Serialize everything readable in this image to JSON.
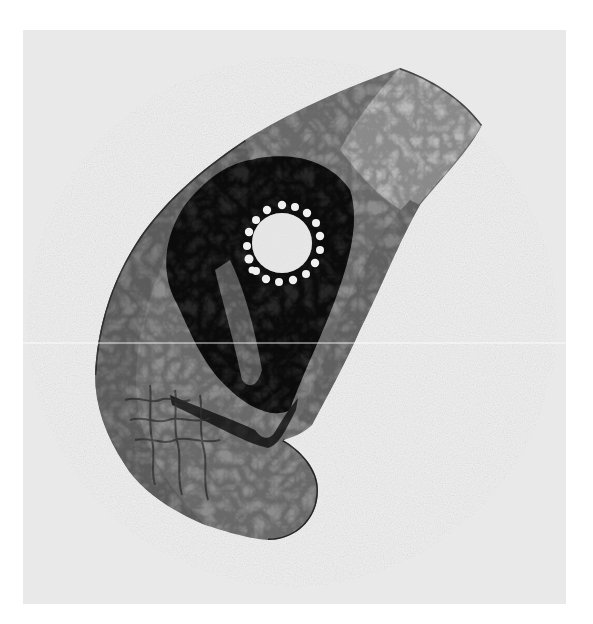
{
  "image": {
    "description": "Grayscale micrograph of a curved tissue section with a bright circular body ringed by small beads",
    "colors": {
      "page": "#ffffff",
      "plate": "#e9e9e9",
      "field_ring": "#f2f2f2",
      "tissue_light": "#9a9a9a",
      "tissue_mid": "#6a6a6a",
      "tissue_dark": "#1e1e1e",
      "central_body": "#f4f4f4",
      "scan_line": "#ffffff"
    },
    "features": [
      {
        "name": "central-spherical-body",
        "cx": 282,
        "cy": 243,
        "r": 30
      },
      {
        "name": "bead-ring",
        "count": 18
      },
      {
        "name": "dark-stained-zone"
      },
      {
        "name": "bottom-lobe"
      },
      {
        "name": "scan-line-artifact",
        "y": 343
      }
    ]
  }
}
